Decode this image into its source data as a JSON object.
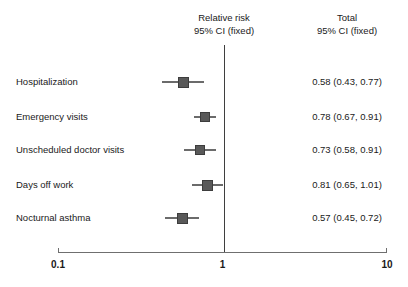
{
  "header": {
    "effect_col": {
      "line1": "Relative risk",
      "line2": "95% CI (fixed)"
    },
    "total_col": {
      "line1": "Total",
      "line2": "95% CI (fixed)"
    }
  },
  "axis": {
    "scale": "log10",
    "ticks": [
      "0.1",
      "1",
      "10"
    ],
    "tick_values": [
      0.1,
      1,
      10
    ],
    "reference_value": 1
  },
  "chart_data": {
    "type": "forest",
    "title": "",
    "xlabel": "",
    "ylabel": "",
    "xscale": "log",
    "xlim": [
      0.1,
      10
    ],
    "grid": false,
    "legend": null,
    "effect_measure": "Relative risk",
    "ci_level": "95% CI (fixed)",
    "reference_line": 1,
    "columns": [
      "Relative risk 95% CI (fixed)",
      "Total 95% CI (fixed)"
    ],
    "categories": [
      "Hospitalization",
      "Emergency visits",
      "Unscheduled doctor visits",
      "Days off work",
      "Nocturnal asthma"
    ],
    "values": [
      0.58,
      0.78,
      0.73,
      0.81,
      0.57
    ],
    "ci_low": [
      0.43,
      0.67,
      0.58,
      0.65,
      0.45
    ],
    "ci_high": [
      0.77,
      0.91,
      0.91,
      1.01,
      0.72
    ],
    "rows": [
      {
        "label": "Hospitalization",
        "estimate": 0.58,
        "low": 0.43,
        "high": 0.77,
        "text": "0.58 (0.43, 0.77)",
        "marker_size": 11
      },
      {
        "label": "Emergency visits",
        "estimate": 0.78,
        "low": 0.67,
        "high": 0.91,
        "text": "0.78 (0.67, 0.91)",
        "marker_size": 10
      },
      {
        "label": "Unscheduled doctor visits",
        "estimate": 0.73,
        "low": 0.58,
        "high": 0.91,
        "text": "0.73 (0.58, 0.91)",
        "marker_size": 10
      },
      {
        "label": "Days off work",
        "estimate": 0.81,
        "low": 0.65,
        "high": 1.01,
        "text": "0.81 (0.65, 1.01)",
        "marker_size": 11
      },
      {
        "label": "Nocturnal asthma",
        "estimate": 0.57,
        "low": 0.45,
        "high": 0.72,
        "text": "0.57 (0.45, 0.72)",
        "marker_size": 11
      }
    ]
  },
  "style": {
    "marker_color": "#595959",
    "whisker_color": "#6b6b6b",
    "axis_color": "#6f6f6f",
    "reference_line_color": "#3f3f3f",
    "text_color": "#1a1a1a",
    "background": "#ffffff"
  },
  "geometry": {
    "axis_left_px": 58,
    "axis_right_px": 387,
    "axis_y_px": 252,
    "row_y_px": [
      82,
      117,
      150,
      185,
      218
    ]
  }
}
